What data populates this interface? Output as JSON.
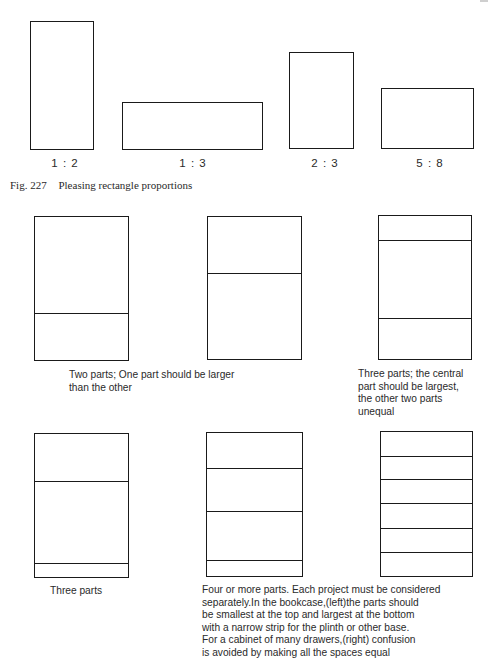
{
  "figure": {
    "number": "Fig. 227",
    "title": "Pleasing rectangle proportions"
  },
  "top_row": {
    "rectangles": [
      {
        "label": "1 : 2",
        "ratio": "1:2"
      },
      {
        "label": "1 : 3",
        "ratio": "1:3"
      },
      {
        "label": "2 : 3",
        "ratio": "2:3"
      },
      {
        "label": "5 : 8",
        "ratio": "5:8"
      }
    ]
  },
  "middle_row": {
    "two_parts_caption_line1": "Two parts; One part should be larger",
    "two_parts_caption_line2": "than the other",
    "three_parts_caption_line1": "Three parts; the central",
    "three_parts_caption_line2": "part should be largest,",
    "three_parts_caption_line3": "the other two parts",
    "three_parts_caption_line4": "unequal"
  },
  "bottom_row": {
    "three_parts_caption": "Three parts",
    "four_or_more_caption_lines": [
      "Four or more parts. Each project must be considered",
      "separately.In the bookcase,(left)the parts should",
      "be smallest at the top and largest at the bottom",
      "with a  narrow strip for the plinth or other base.",
      "For a cabinet of many drawers,(right) confusion",
      "is avoided by making all the spaces equal"
    ]
  },
  "diagrams": {
    "two_parts_lower_divider": {
      "description": "Rectangle divided into two unequal parts, larger part on top"
    },
    "two_parts_upper_divider": {
      "description": "Rectangle divided into two unequal parts, larger part on bottom"
    },
    "three_parts_central_largest": {
      "description": "Rectangle divided into three parts, central part largest"
    },
    "three_parts_plinth": {
      "description": "Rectangle divided into three parts with narrow base strip"
    },
    "bookcase": {
      "description": "Four parts, smallest at top, largest at bottom, narrow plinth strip"
    },
    "cabinet_of_drawers": {
      "description": "Six equal drawer spaces"
    }
  }
}
